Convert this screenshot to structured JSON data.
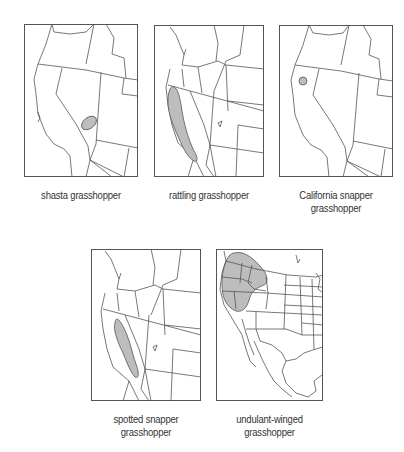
{
  "figure": {
    "colors": {
      "background": "#ffffff",
      "map_lines": "#555555",
      "range_fill": "#bdbdbd",
      "caption_text": "#333333"
    },
    "maps": [
      {
        "id": "shasta",
        "caption_lines": [
          "shasta grasshopper"
        ],
        "region": "western-us",
        "range_shape": "small ellipse in southwestern Nevada / eastern California border"
      },
      {
        "id": "rattling",
        "caption_lines": [
          "rattling grasshopper"
        ],
        "region": "western-us",
        "range_shape": "elongated band along central California"
      },
      {
        "id": "california-snapper",
        "caption_lines": [
          "California snapper",
          "grasshopper"
        ],
        "region": "western-us",
        "range_shape": "small circle in northern California"
      },
      {
        "id": "spotted-snapper",
        "caption_lines": [
          "spotted snapper",
          "grasshopper"
        ],
        "region": "western-us",
        "range_shape": "elongated band along eastern California / Sierra Nevada"
      },
      {
        "id": "undulant-winged",
        "caption_lines": [
          "undulant-winged",
          "grasshopper"
        ],
        "region": "north-america",
        "range_shape": "large area covering Oregon, Washington, Idaho, northern Nevada and northern California"
      }
    ]
  }
}
